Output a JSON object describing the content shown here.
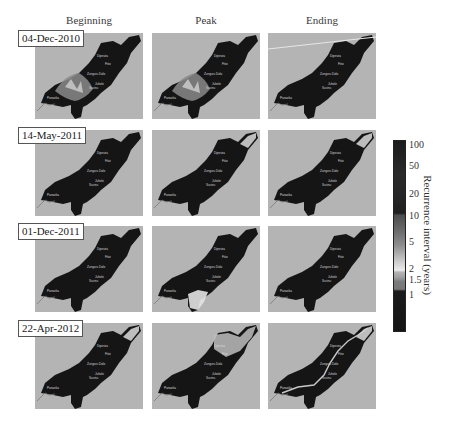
{
  "columns": [
    "Beginning",
    "Peak",
    "Ending"
  ],
  "rows": [
    {
      "date": "04-Dec-2010",
      "panels": [
        {
          "name": "beginning",
          "highlight": "southwest-bright"
        },
        {
          "name": "peak",
          "highlight": "southwest-bright"
        },
        {
          "name": "ending",
          "highlight": "faint"
        }
      ]
    },
    {
      "date": "14-May-2011",
      "panels": [
        {
          "name": "beginning",
          "highlight": "none"
        },
        {
          "name": "peak",
          "highlight": "northeast-tip"
        },
        {
          "name": "ending",
          "highlight": "northeast-tip"
        }
      ]
    },
    {
      "date": "01-Dec-2011",
      "panels": [
        {
          "name": "beginning",
          "highlight": "none"
        },
        {
          "name": "peak",
          "highlight": "south-bright"
        },
        {
          "name": "ending",
          "highlight": "none"
        }
      ]
    },
    {
      "date": "22-Apr-2012",
      "panels": [
        {
          "name": "beginning",
          "highlight": "northeast-tip"
        },
        {
          "name": "peak",
          "highlight": "northeast-bright"
        },
        {
          "name": "ending",
          "highlight": "river-bright"
        }
      ]
    }
  ],
  "colorbar": {
    "title": "Recurrence interval (years)",
    "ticks": [
      "100",
      "50",
      "20",
      "10",
      "5",
      "2",
      "1.5",
      "1"
    ]
  },
  "towns": [
    "Dipesira",
    "Fitio",
    "Zunguru",
    "Dolo",
    "Juhole",
    "Sucinu",
    "Panaeka"
  ]
}
